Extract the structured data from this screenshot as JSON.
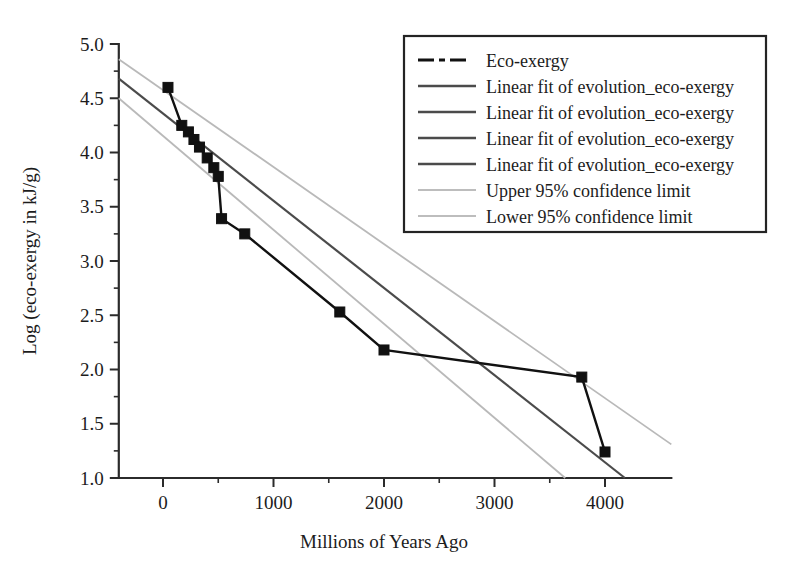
{
  "chart_data": {
    "type": "line",
    "title": "",
    "xlabel": "Millions of Years Ago",
    "ylabel": "Log (eco-exergy in kJ/g)",
    "xlim": [
      -400,
      4600
    ],
    "ylim": [
      1.0,
      5.0
    ],
    "grid": false,
    "legend_position": "top-right",
    "x_ticks": [
      0,
      1000,
      2000,
      3000,
      4000
    ],
    "x_tick_labels": [
      "0",
      "1000",
      "2000",
      "3000",
      "4000"
    ],
    "x_minor_ticks": [
      500,
      1500,
      2500,
      3500
    ],
    "y_ticks": [
      1.0,
      1.5,
      2.0,
      2.5,
      3.0,
      3.5,
      4.0,
      4.5,
      5.0
    ],
    "y_tick_labels": [
      "1.0",
      "1.5",
      "2.0",
      "2.5",
      "3.0",
      "3.5",
      "4.0",
      "4.5",
      "5.0"
    ],
    "y_minor_ticks": [
      1.25,
      1.75,
      2.25,
      2.75,
      3.25,
      3.75,
      4.25,
      4.75
    ],
    "series": [
      {
        "name": "Eco-exergy",
        "type": "line-markers",
        "marker": "square",
        "color": "#111111",
        "x": [
          45,
          170,
          230,
          280,
          330,
          400,
          460,
          500,
          530,
          740,
          1600,
          2000,
          3790,
          4000
        ],
        "y": [
          4.6,
          4.25,
          4.19,
          4.12,
          4.05,
          3.95,
          3.86,
          3.78,
          3.39,
          3.25,
          2.53,
          2.18,
          1.93,
          1.24
        ]
      },
      {
        "name": "Linear fit of evolution_eco-exergy",
        "type": "line",
        "color": "#4b4b4b",
        "x": [
          -400,
          4180
        ],
        "y": [
          4.68,
          1.0
        ]
      },
      {
        "name": "Upper 95% confidence limit",
        "type": "line",
        "color": "#b9b9b9",
        "x": [
          -400,
          4600
        ],
        "y": [
          4.86,
          1.31
        ]
      },
      {
        "name": "Lower 95% confidence limit",
        "type": "line",
        "color": "#b9b9b9",
        "x": [
          -400,
          3640
        ],
        "y": [
          4.5,
          1.0
        ]
      }
    ]
  },
  "legend": {
    "entries": [
      {
        "label": "Eco-exergy",
        "style": "dash-dot",
        "color": "#111111"
      },
      {
        "label": "Linear fit of evolution_eco-exergy",
        "style": "solid",
        "color": "#4b4b4b"
      },
      {
        "label": "Linear fit of evolution_eco-exergy",
        "style": "solid",
        "color": "#4b4b4b"
      },
      {
        "label": "Linear fit of evolution_eco-exergy",
        "style": "solid",
        "color": "#4b4b4b"
      },
      {
        "label": "Linear fit of evolution_eco-exergy",
        "style": "solid",
        "color": "#4b4b4b"
      },
      {
        "label": "Upper 95% confidence limit",
        "style": "solid-light",
        "color": "#bdbdbd"
      },
      {
        "label": "Lower 95% confidence limit",
        "style": "solid-light",
        "color": "#bdbdbd"
      }
    ]
  },
  "axes": {
    "x_title": "Millions of Years Ago",
    "y_title": "Log (eco-exergy in kJ/g)"
  }
}
